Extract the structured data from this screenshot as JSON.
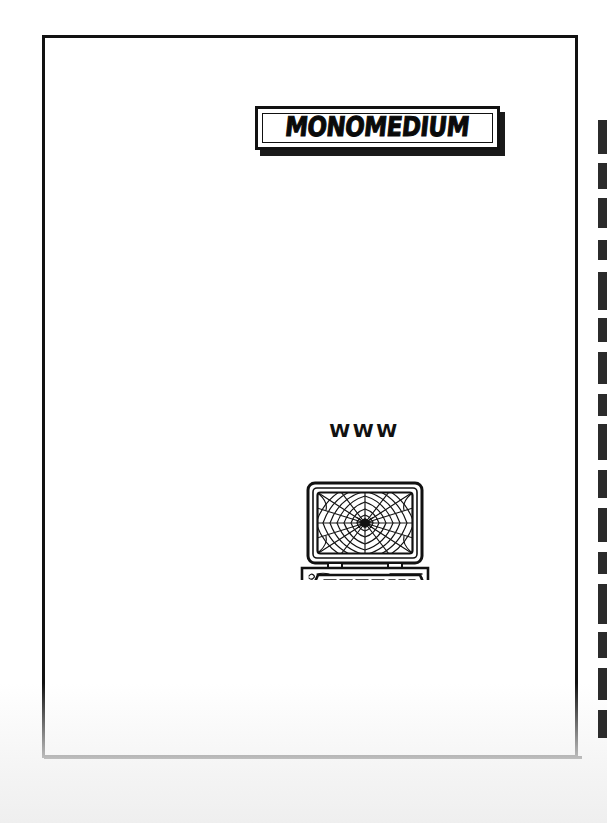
{
  "page": {
    "background_color": "#ffffff",
    "ink_color": "#111111",
    "frame": {
      "name": "page-border-frame",
      "x": 42,
      "y": 35,
      "width": 536,
      "height": 723,
      "stroke_width": 3
    }
  },
  "title": {
    "text": "MONOMEDIUM",
    "style": "bold hand-drawn graffiti capitals",
    "box": {
      "x": 210,
      "y": 68,
      "width": 245,
      "height": 44,
      "has_drop_shadow": true
    }
  },
  "illustration": {
    "name": "computer-with-spiderweb",
    "label": "WWW",
    "caption_position": "above-monitor",
    "x": 247,
    "y": 382,
    "width": 145,
    "height": 160,
    "parts": [
      {
        "name": "monitor-bezel",
        "description": "rounded rectangular CRT monitor casing"
      },
      {
        "name": "monitor-screen",
        "description": "screen filled with a radial spider web"
      },
      {
        "name": "spider",
        "description": "small spider at the centre of the web"
      },
      {
        "name": "monitor-stand",
        "description": "two short legs under the monitor"
      },
      {
        "name": "computer-base",
        "description": "horizontal desktop case with drive slot and scribbled logo"
      },
      {
        "name": "keyboard",
        "description": "trapezoidal keyboard drawn in perspective with rows of keys"
      }
    ]
  },
  "scan_artifact": {
    "name": "right-edge-binding-marks",
    "description": "broken vertical dashed dark band along the right edge of the scan",
    "color": "#2b2b2b",
    "segments": [
      {
        "top": 120,
        "height": 34
      },
      {
        "top": 163,
        "height": 26
      },
      {
        "top": 198,
        "height": 30
      },
      {
        "top": 240,
        "height": 20
      },
      {
        "top": 272,
        "height": 38
      },
      {
        "top": 318,
        "height": 24
      },
      {
        "top": 352,
        "height": 32
      },
      {
        "top": 394,
        "height": 22
      },
      {
        "top": 424,
        "height": 36
      },
      {
        "top": 470,
        "height": 28
      },
      {
        "top": 508,
        "height": 34
      },
      {
        "top": 552,
        "height": 22
      },
      {
        "top": 584,
        "height": 40
      },
      {
        "top": 632,
        "height": 26
      },
      {
        "top": 668,
        "height": 32
      },
      {
        "top": 710,
        "height": 28
      }
    ]
  }
}
